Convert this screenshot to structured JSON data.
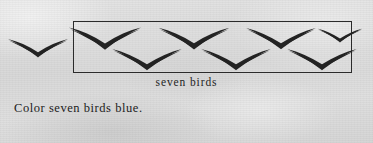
{
  "page": {
    "type": "worksheet-page",
    "paper_color": "#dcdcdc",
    "ink_color": "#232323",
    "width": 373,
    "height": 143
  },
  "illustration": {
    "caption": "seven birds",
    "box": {
      "name": "bird-group-box",
      "x": 73,
      "y": 21,
      "width": 279,
      "height": 52,
      "border_color": "#2b2b2b",
      "border_width": 1
    },
    "birds_in_box_count": 7,
    "birds_outside_box_count": 1,
    "total_birds_drawn": 8,
    "bird_icon_name": "gull-bird-icon",
    "birds": [
      {
        "id": "bird-outside-1",
        "in_box": false,
        "row": "single",
        "cx": 38,
        "cy": 46,
        "scale": 1.0
      },
      {
        "id": "bird-1",
        "in_box": true,
        "row": "upper",
        "cx": 105,
        "cy": 36,
        "scale": 1.2
      },
      {
        "id": "bird-2",
        "in_box": true,
        "row": "upper",
        "cx": 194,
        "cy": 36,
        "scale": 1.18
      },
      {
        "id": "bird-3",
        "in_box": true,
        "row": "upper",
        "cx": 281,
        "cy": 36,
        "scale": 1.16
      },
      {
        "id": "bird-4",
        "in_box": true,
        "row": "lower",
        "cx": 147,
        "cy": 57,
        "scale": 1.16
      },
      {
        "id": "bird-5",
        "in_box": true,
        "row": "lower",
        "cx": 236,
        "cy": 57,
        "scale": 1.16
      },
      {
        "id": "bird-6",
        "in_box": true,
        "row": "lower",
        "cx": 322,
        "cy": 57,
        "scale": 1.16
      },
      {
        "id": "bird-7",
        "in_box": true,
        "row": "upper",
        "cx": 340,
        "cy": 36,
        "scale": 0.7
      }
    ]
  },
  "instruction": {
    "text": "Color seven birds blue.",
    "color_word": "blue",
    "count_word": "seven",
    "object_word": "birds"
  }
}
